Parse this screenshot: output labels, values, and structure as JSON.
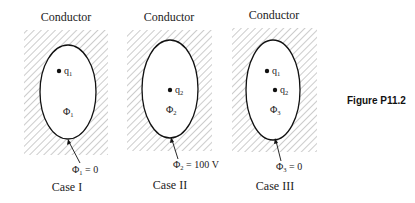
{
  "figure_label": "Figure P11.2",
  "colors": {
    "stroke": "#111111",
    "hatch": "#9a9a9a",
    "background": "#ffffff"
  },
  "cases": [
    {
      "title": "Conductor",
      "case_label": "Case I",
      "charges": [
        {
          "symbol": "q",
          "sub": "1"
        }
      ],
      "region_label": {
        "symbol": "Φ",
        "sub": "1"
      },
      "boundary_label": {
        "symbol": "Φ",
        "sub": "1",
        "value": " = 0"
      }
    },
    {
      "title": "Conductor",
      "case_label": "Case II",
      "charges": [
        {
          "symbol": "q",
          "sub": "2"
        }
      ],
      "region_label": {
        "symbol": "Φ",
        "sub": "2"
      },
      "boundary_label": {
        "symbol": "Φ",
        "sub": "2",
        "value": " = 100 V"
      }
    },
    {
      "title": "Conductor",
      "case_label": "Case III",
      "charges": [
        {
          "symbol": "q",
          "sub": "1"
        },
        {
          "symbol": "q",
          "sub": "2"
        }
      ],
      "region_label": {
        "symbol": "Φ",
        "sub": "3"
      },
      "boundary_label": {
        "symbol": "Φ",
        "sub": "3",
        "value": " = 0"
      }
    }
  ]
}
